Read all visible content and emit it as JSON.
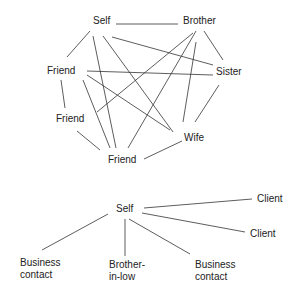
{
  "diagrams": [
    {
      "name": "dense-network",
      "nodes": [
        {
          "id": "self",
          "label": "Self",
          "x": 93,
          "y": 24
        },
        {
          "id": "brother",
          "label": "Brother",
          "x": 183,
          "y": 24
        },
        {
          "id": "friend1",
          "label": "Friend",
          "x": 47,
          "y": 74
        },
        {
          "id": "sister",
          "label": "Sister",
          "x": 216,
          "y": 75
        },
        {
          "id": "friend2",
          "label": "Friend",
          "x": 56,
          "y": 122
        },
        {
          "id": "wife",
          "label": "Wife",
          "x": 184,
          "y": 141
        },
        {
          "id": "friend3",
          "label": "Friend",
          "x": 108,
          "y": 163
        }
      ],
      "edges": [
        {
          "from": "self",
          "to": "brother",
          "x1": 116,
          "y1": 24,
          "x2": 178,
          "y2": 24
        },
        {
          "from": "self",
          "to": "friend1",
          "x1": 90,
          "y1": 31,
          "x2": 67,
          "y2": 57
        },
        {
          "from": "self",
          "to": "friend3",
          "x1": 93,
          "y1": 36,
          "x2": 116,
          "y2": 148
        },
        {
          "from": "self",
          "to": "wife",
          "x1": 103,
          "y1": 36,
          "x2": 173,
          "y2": 132
        },
        {
          "from": "self",
          "to": "sister",
          "x1": 112,
          "y1": 37,
          "x2": 213,
          "y2": 65
        },
        {
          "from": "brother",
          "to": "sister",
          "x1": 204,
          "y1": 31,
          "x2": 223,
          "y2": 60
        },
        {
          "from": "brother",
          "to": "friend2",
          "x1": 193,
          "y1": 33,
          "x2": 97,
          "y2": 112
        },
        {
          "from": "brother",
          "to": "friend3",
          "x1": 196,
          "y1": 31,
          "x2": 128,
          "y2": 148
        },
        {
          "from": "brother",
          "to": "wife",
          "x1": 196,
          "y1": 42,
          "x2": 183,
          "y2": 122
        },
        {
          "from": "friend1",
          "to": "sister",
          "x1": 87,
          "y1": 71,
          "x2": 213,
          "y2": 75
        },
        {
          "from": "friend1",
          "to": "wife",
          "x1": 87,
          "y1": 75,
          "x2": 170,
          "y2": 130
        },
        {
          "from": "friend1",
          "to": "friend2",
          "x1": 61,
          "y1": 80,
          "x2": 65,
          "y2": 108
        },
        {
          "from": "friend1",
          "to": "friend3",
          "x1": 83,
          "y1": 80,
          "x2": 110,
          "y2": 148
        },
        {
          "from": "friend2",
          "to": "friend3",
          "x1": 77,
          "y1": 131,
          "x2": 100,
          "y2": 150
        },
        {
          "from": "sister",
          "to": "wife",
          "x1": 219,
          "y1": 85,
          "x2": 195,
          "y2": 122
        },
        {
          "from": "wife",
          "to": "friend3",
          "x1": 182,
          "y1": 141,
          "x2": 144,
          "y2": 159
        }
      ]
    },
    {
      "name": "radial-network",
      "nodes": [
        {
          "id": "self",
          "label": "Self",
          "x": 116,
          "y": 212,
          "lines": [
            "Self"
          ]
        },
        {
          "id": "client1",
          "label": "Client",
          "x": 257,
          "y": 202,
          "lines": [
            "Client"
          ]
        },
        {
          "id": "client2",
          "label": "Client",
          "x": 250,
          "y": 237,
          "lines": [
            "Client"
          ]
        },
        {
          "id": "business-contact-left",
          "label": "Business contact",
          "x": 20,
          "y": 266,
          "lines": [
            "Business",
            "contact"
          ]
        },
        {
          "id": "brother-in-law",
          "label": "Brother-in-low",
          "x": 109,
          "y": 268,
          "lines": [
            "Brother-",
            "in-low"
          ]
        },
        {
          "id": "business-contact-right",
          "label": "Business contact",
          "x": 195,
          "y": 268,
          "lines": [
            "Business",
            "contact"
          ]
        }
      ],
      "edges": [
        {
          "from": "self",
          "to": "client1",
          "x1": 144,
          "y1": 208,
          "x2": 252,
          "y2": 199
        },
        {
          "from": "self",
          "to": "client2",
          "x1": 142,
          "y1": 213,
          "x2": 245,
          "y2": 232
        },
        {
          "from": "self",
          "to": "business-contact-left",
          "x1": 108,
          "y1": 214,
          "x2": 42,
          "y2": 250
        },
        {
          "from": "self",
          "to": "brother-in-law",
          "x1": 125,
          "y1": 219,
          "x2": 125,
          "y2": 256
        },
        {
          "from": "self",
          "to": "business-contact-right",
          "x1": 129,
          "y1": 219,
          "x2": 190,
          "y2": 254
        }
      ]
    }
  ],
  "colors": {
    "background": "#ffffff",
    "line": "#333333",
    "text": "#222222"
  }
}
